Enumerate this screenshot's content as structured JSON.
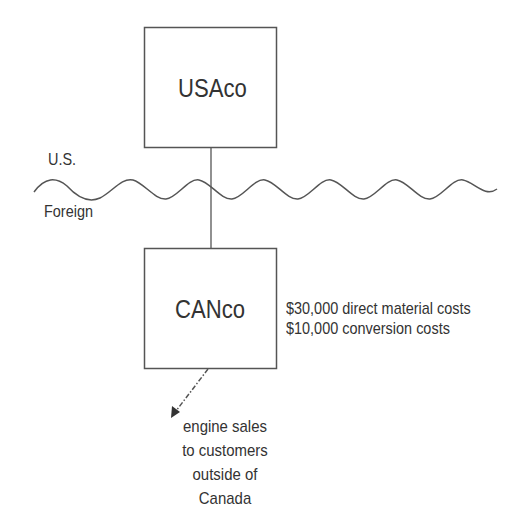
{
  "diagram": {
    "parent": {
      "label": "USAco"
    },
    "subsidiary": {
      "label": "CANco"
    },
    "border": {
      "upper_label": "U.S.",
      "lower_label": "Foreign"
    },
    "costs": [
      "$30,000 direct material costs",
      "$10,000 conversion costs"
    ],
    "sales_note": {
      "lines": [
        "engine sales",
        "to customers",
        "outside of",
        "Canada"
      ]
    },
    "colors": {
      "line": "#555555",
      "text": "#333333",
      "background": "#ffffff"
    }
  }
}
